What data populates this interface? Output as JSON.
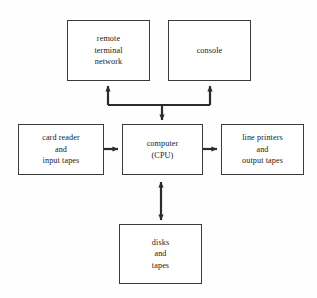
{
  "diagram": {
    "type": "block-diagram",
    "background_color": "#fefefe",
    "line_color": "#2b2b2b",
    "box_border_color": "#3a3a3a",
    "box_fill_color": "#ffffff",
    "nodes": [
      {
        "id": "remote",
        "lines": [
          "remote",
          "terminal",
          "network"
        ],
        "x": 67,
        "y": 20,
        "w": 83,
        "h": 61
      },
      {
        "id": "console",
        "lines": [
          "console"
        ],
        "x": 168,
        "y": 20,
        "w": 83,
        "h": 61
      },
      {
        "id": "card",
        "lines": [
          "card reader",
          "and",
          "input tapes"
        ],
        "x": 18,
        "y": 124,
        "w": 86,
        "h": 51
      },
      {
        "id": "cpu",
        "lines": [
          "computer",
          "(CPU)"
        ],
        "x": 122,
        "y": 124,
        "w": 81,
        "h": 51
      },
      {
        "id": "printer",
        "lines": [
          "line printers",
          "and",
          "output tapes"
        ],
        "x": 221,
        "y": 124,
        "w": 83,
        "h": 51
      },
      {
        "id": "disks",
        "lines": [
          "disks",
          "and",
          "tapes"
        ],
        "x": 119,
        "y": 224,
        "w": 83,
        "h": 60
      }
    ],
    "connectors": [
      {
        "id": "card-to-cpu",
        "from": "card",
        "to": "cpu",
        "direction": "single",
        "orientation": "horizontal"
      },
      {
        "id": "cpu-to-printer",
        "from": "cpu",
        "to": "printer",
        "direction": "single",
        "orientation": "horizontal"
      },
      {
        "id": "cpu-to-disks",
        "from": "cpu",
        "to": "disks",
        "direction": "double",
        "orientation": "vertical"
      },
      {
        "id": "bus-to-remote",
        "from": "bus",
        "to": "remote",
        "direction": "single",
        "orientation": "vertical"
      },
      {
        "id": "bus-to-console",
        "from": "bus",
        "to": "console",
        "direction": "single",
        "orientation": "vertical"
      },
      {
        "id": "cpu-to-bus",
        "from": "bus",
        "to": "cpu",
        "direction": "single",
        "orientation": "vertical"
      }
    ]
  }
}
